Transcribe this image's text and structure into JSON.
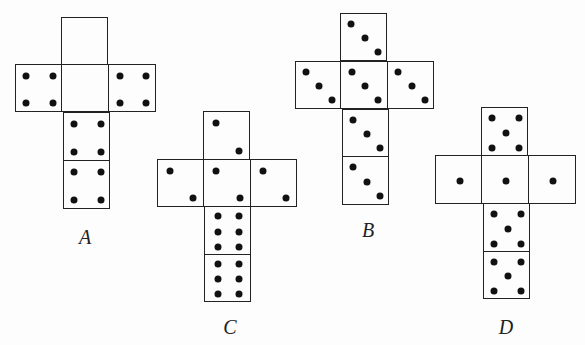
{
  "figure": {
    "pip_layouts": {
      "blank": [],
      "one": [
        [
          0.5,
          0.5
        ]
      ],
      "two_diag": [
        [
          0.25,
          0.22
        ],
        [
          0.75,
          0.8
        ]
      ],
      "three_diag": [
        [
          0.22,
          0.2
        ],
        [
          0.5,
          0.5
        ],
        [
          0.78,
          0.8
        ]
      ],
      "four": [
        [
          0.22,
          0.22
        ],
        [
          0.78,
          0.22
        ],
        [
          0.22,
          0.8
        ],
        [
          0.78,
          0.8
        ]
      ],
      "five": [
        [
          0.22,
          0.2
        ],
        [
          0.78,
          0.2
        ],
        [
          0.5,
          0.5
        ],
        [
          0.22,
          0.82
        ],
        [
          0.78,
          0.82
        ]
      ],
      "six": [
        [
          0.27,
          0.18
        ],
        [
          0.73,
          0.18
        ],
        [
          0.27,
          0.5
        ],
        [
          0.73,
          0.5
        ],
        [
          0.27,
          0.82
        ],
        [
          0.73,
          0.82
        ]
      ]
    },
    "nets": [
      {
        "label": "A",
        "label_pos": [
          85,
          237
        ],
        "faces": [
          {
            "x": 61,
            "y": 17,
            "w": 47,
            "h": 48,
            "pips": "blank",
            "count": 0
          },
          {
            "x": 15,
            "y": 64,
            "w": 47,
            "h": 48,
            "pips": "four",
            "count": 4
          },
          {
            "x": 61,
            "y": 64,
            "w": 48,
            "h": 48,
            "pips": "blank",
            "count": 0
          },
          {
            "x": 108,
            "y": 64,
            "w": 48,
            "h": 48,
            "pips": "four",
            "count": 4
          },
          {
            "x": 63,
            "y": 112,
            "w": 47,
            "h": 49,
            "pips": "four",
            "count": 4
          },
          {
            "x": 63,
            "y": 160,
            "w": 47,
            "h": 49,
            "pips": "four",
            "count": 4
          }
        ]
      },
      {
        "label": "B",
        "label_pos": [
          368,
          230
        ],
        "faces": [
          {
            "x": 340,
            "y": 13,
            "w": 47,
            "h": 48,
            "pips": "three_diag",
            "count": 3
          },
          {
            "x": 295,
            "y": 61,
            "w": 46,
            "h": 48,
            "pips": "three_diag",
            "count": 3
          },
          {
            "x": 340,
            "y": 61,
            "w": 48,
            "h": 48,
            "pips": "three_diag",
            "count": 3
          },
          {
            "x": 387,
            "y": 61,
            "w": 47,
            "h": 48,
            "pips": "three_diag",
            "count": 3
          },
          {
            "x": 342,
            "y": 109,
            "w": 47,
            "h": 48,
            "pips": "three_diag",
            "count": 3
          },
          {
            "x": 342,
            "y": 156,
            "w": 47,
            "h": 49,
            "pips": "three_diag",
            "count": 3
          }
        ]
      },
      {
        "label": "C",
        "label_pos": [
          230,
          327
        ],
        "faces": [
          {
            "x": 203,
            "y": 111,
            "w": 47,
            "h": 49,
            "pips": "two_diag",
            "count": 2
          },
          {
            "x": 157,
            "y": 159,
            "w": 47,
            "h": 48,
            "pips": "two_diag",
            "count": 2
          },
          {
            "x": 203,
            "y": 159,
            "w": 48,
            "h": 48,
            "pips": "two_diag",
            "count": 2
          },
          {
            "x": 250,
            "y": 159,
            "w": 47,
            "h": 48,
            "pips": "two_diag",
            "count": 2
          },
          {
            "x": 204,
            "y": 206,
            "w": 47,
            "h": 49,
            "pips": "six",
            "count": 6
          },
          {
            "x": 204,
            "y": 254,
            "w": 47,
            "h": 48,
            "pips": "six",
            "count": 6
          }
        ]
      },
      {
        "label": "D",
        "label_pos": [
          506,
          327
        ],
        "faces": [
          {
            "x": 481,
            "y": 107,
            "w": 47,
            "h": 49,
            "pips": "five",
            "count": 5
          },
          {
            "x": 435,
            "y": 155,
            "w": 47,
            "h": 49,
            "pips": "one",
            "count": 1
          },
          {
            "x": 481,
            "y": 155,
            "w": 48,
            "h": 49,
            "pips": "one",
            "count": 1
          },
          {
            "x": 528,
            "y": 155,
            "w": 48,
            "h": 49,
            "pips": "one",
            "count": 1
          },
          {
            "x": 483,
            "y": 203,
            "w": 47,
            "h": 49,
            "pips": "five",
            "count": 5
          },
          {
            "x": 483,
            "y": 251,
            "w": 47,
            "h": 48,
            "pips": "five",
            "count": 5
          }
        ]
      }
    ]
  }
}
